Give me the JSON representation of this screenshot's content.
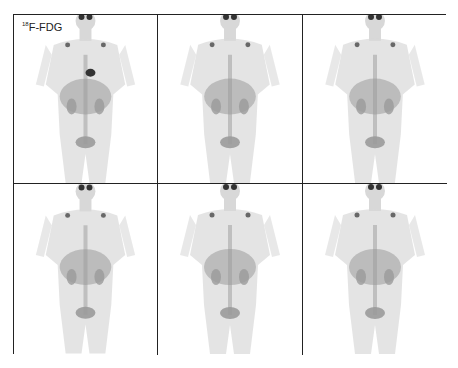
{
  "figure": {
    "tracer_label_sup": "18",
    "tracer_label_main": "F-FDG",
    "panels": [
      {
        "row": 1,
        "col": 1,
        "has_label": true,
        "heart_uptake": true
      },
      {
        "row": 1,
        "col": 2,
        "has_label": false,
        "heart_uptake": false
      },
      {
        "row": 1,
        "col": 3,
        "has_label": false,
        "heart_uptake": false
      },
      {
        "row": 2,
        "col": 1,
        "has_label": false,
        "heart_uptake": false
      },
      {
        "row": 2,
        "col": 2,
        "has_label": false,
        "heart_uptake": false
      },
      {
        "row": 2,
        "col": 3,
        "has_label": false,
        "heart_uptake": false
      }
    ],
    "colors": {
      "border": "#222222",
      "body": "#d8d8d8",
      "organ": "#9a9a9a",
      "hot": "#333333"
    }
  }
}
